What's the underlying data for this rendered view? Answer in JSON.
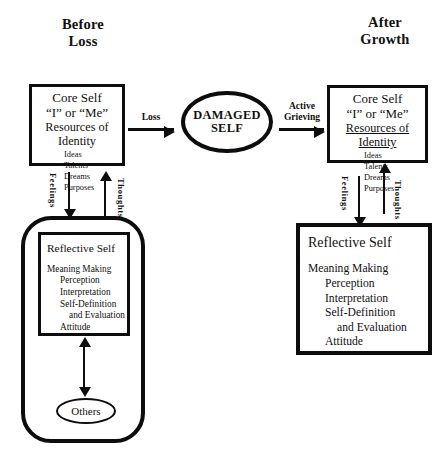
{
  "diagram": {
    "headers": {
      "left": "Before\nLoss",
      "left_line1": "Before",
      "left_line2": "Loss",
      "right_line1": "After",
      "right_line2": "Growth"
    },
    "core_self_left": {
      "title": "Core Self",
      "subtitle": "“I” or “Me”",
      "resources_heading": "Resources of Identity",
      "resources": [
        "Ideas",
        "Talents",
        "Dreams",
        "Purposes"
      ]
    },
    "core_self_right": {
      "title": "Core Self",
      "subtitle": "“I” or “Me”",
      "resources_heading": "Resources of Identity",
      "resources": [
        "Ideas",
        "Talents",
        "Dreams",
        "Purposes"
      ]
    },
    "damaged_self": {
      "line1": "DAMAGED",
      "line2": "SELF"
    },
    "arrows": {
      "loss_label": "Loss",
      "grieving_line1": "Active",
      "grieving_line2": "Grieving",
      "feelings_label": "Feelings",
      "thoughts_label": "Thoughts"
    },
    "reflective_self_left": {
      "title": "Reflective Self",
      "items": [
        "Meaning Making",
        "Perception",
        "Interpretation",
        "Self-Definition",
        "and Evaluation",
        "Attitude"
      ]
    },
    "reflective_self_right": {
      "title": "Reflective Self",
      "items": [
        "Meaning Making",
        "Perception",
        "Interpretation",
        "Self-Definition",
        "and Evaluation",
        "Attitude"
      ]
    },
    "others": {
      "label": "Others"
    },
    "colors": {
      "ink": "#0d0d0d",
      "background": "#ffffff"
    }
  }
}
